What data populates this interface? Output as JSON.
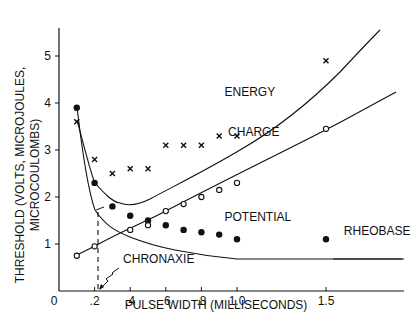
{
  "chart_data": {
    "type": "line",
    "title": "",
    "xlabel": "PULSE WIDTH (MILLISECONDS)",
    "ylabel_line1": "THRESHOLD (VOLTS, MICROJOULES,",
    "ylabel_line2": "MICROCOULOMBS)",
    "xlim": [
      0,
      1.95
    ],
    "ylim": [
      0,
      5.5
    ],
    "x_ticks": [
      {
        "v": 0,
        "label": "0"
      },
      {
        "v": 0.2,
        "label": ".2"
      },
      {
        "v": 0.4,
        "label": ".4"
      },
      {
        "v": 0.6,
        "label": ".6"
      },
      {
        "v": 0.8,
        "label": ".8"
      },
      {
        "v": 1.0,
        "label": "1.0"
      },
      {
        "v": 1.5,
        "label": "1.5"
      }
    ],
    "y_ticks": [
      {
        "v": 1,
        "label": "1"
      },
      {
        "v": 2,
        "label": "2"
      },
      {
        "v": 3,
        "label": "3"
      },
      {
        "v": 4,
        "label": "4"
      },
      {
        "v": 5,
        "label": "5"
      }
    ],
    "grid": false,
    "series": [
      {
        "name": "POTENTIAL",
        "marker": "filled-circle",
        "x": [
          0.1,
          0.2,
          0.3,
          0.4,
          0.5,
          0.6,
          0.7,
          0.8,
          0.9,
          1.0,
          1.5
        ],
        "values": [
          3.9,
          2.3,
          1.8,
          1.6,
          1.5,
          1.4,
          1.3,
          1.25,
          1.2,
          1.1,
          1.1
        ]
      },
      {
        "name": "CHARGE",
        "marker": "open-circle",
        "x": [
          0.1,
          0.2,
          0.4,
          0.5,
          0.6,
          0.7,
          0.8,
          0.9,
          1.0,
          1.5
        ],
        "values": [
          0.75,
          0.95,
          1.3,
          1.4,
          1.7,
          1.85,
          2.0,
          2.15,
          2.3,
          3.45
        ]
      },
      {
        "name": "ENERGY",
        "marker": "x",
        "x": [
          0.1,
          0.2,
          0.3,
          0.4,
          0.5,
          0.6,
          0.7,
          0.8,
          0.9,
          1.0,
          1.5
        ],
        "values": [
          3.6,
          2.8,
          2.5,
          2.6,
          2.6,
          3.1,
          3.1,
          3.1,
          3.3,
          3.3,
          4.9
        ]
      }
    ],
    "annotations": [
      {
        "text": "ENERGY",
        "x": 0.93,
        "y": 4.15
      },
      {
        "text": "CHARGE",
        "x": 0.95,
        "y": 3.3
      },
      {
        "text": "POTENTIAL",
        "x": 0.93,
        "y": 1.5
      },
      {
        "text": "RHEOBASE",
        "x": 1.6,
        "y": 1.2
      },
      {
        "text": "CHRONAXIE",
        "x": 0.36,
        "y": 0.6
      }
    ],
    "chronaxie_x": 0.22
  }
}
